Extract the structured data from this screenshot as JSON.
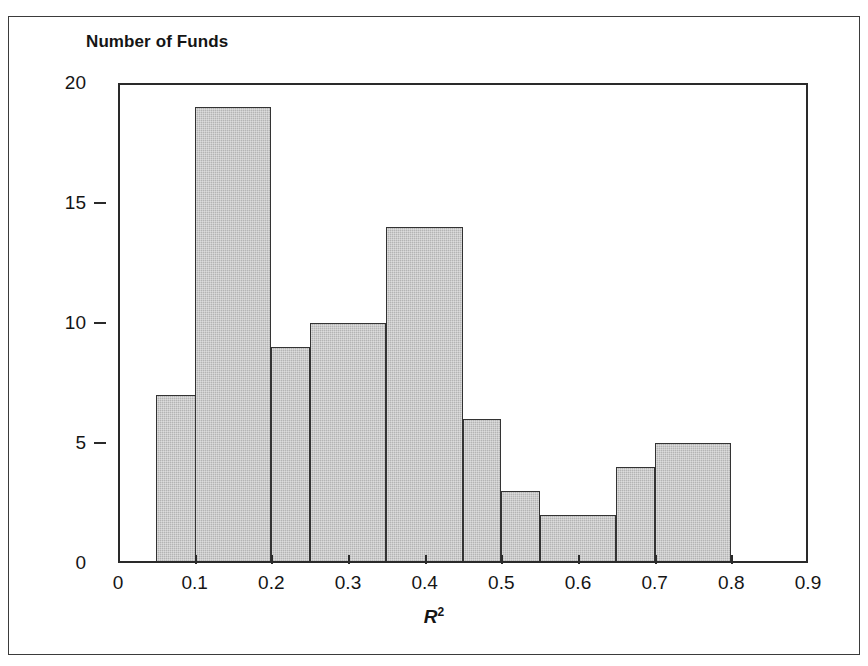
{
  "figure": {
    "clipped_caption": "",
    "background_color": "#ffffff",
    "frame_color": "#3b3b3b"
  },
  "axes": {
    "y_axis_title": "Number of Funds",
    "x_axis_title": "R",
    "x_axis_title_exponent": "2",
    "y_ticks": [
      "0",
      "5",
      "10",
      "15",
      "20"
    ],
    "x_ticks": [
      "0",
      "0.1",
      "0.2",
      "0.3",
      "0.4",
      "0.5",
      "0.6",
      "0.7",
      "0.8",
      "0.9"
    ]
  },
  "chart_data": {
    "type": "bar",
    "title": "",
    "subtitle": "",
    "xlabel": "R^2",
    "ylabel": "Number of Funds",
    "xlim": [
      0,
      0.9
    ],
    "ylim": [
      0,
      20
    ],
    "grid": false,
    "legend": "none",
    "bin_width": 0.05,
    "bin_edges": [
      0.05,
      0.1,
      0.15,
      0.2,
      0.25,
      0.3,
      0.35,
      0.4,
      0.45,
      0.5,
      0.55,
      0.6,
      0.65,
      0.7,
      0.75,
      0.8
    ],
    "categories": [
      "0.05-0.10",
      "0.10-0.15",
      "0.15-0.20",
      "0.20-0.25",
      "0.25-0.30",
      "0.30-0.35",
      "0.35-0.40",
      "0.40-0.45",
      "0.45-0.50",
      "0.50-0.55",
      "0.55-0.60",
      "0.60-0.65",
      "0.65-0.70",
      "0.70-0.75",
      "0.75-0.80"
    ],
    "values": [
      7,
      19,
      19,
      9,
      9,
      10,
      14,
      14,
      6,
      3,
      2,
      2,
      4,
      5,
      5
    ],
    "bars": [
      {
        "label": "0.05-0.15",
        "x_start": 0.05,
        "x_end": 0.15,
        "value": 7
      },
      {
        "label": "0.10-0.20",
        "x_start": 0.1,
        "x_end": 0.2,
        "value": 19
      },
      {
        "label": "0.20-0.25",
        "x_start": 0.2,
        "x_end": 0.25,
        "value": 9
      },
      {
        "label": "0.25-0.35",
        "x_start": 0.25,
        "x_end": 0.35,
        "value": 10
      },
      {
        "label": "0.35-0.45",
        "x_start": 0.35,
        "x_end": 0.45,
        "value": 14
      },
      {
        "label": "0.45-0.50",
        "x_start": 0.45,
        "x_end": 0.5,
        "value": 6
      },
      {
        "label": "0.50-0.55",
        "x_start": 0.5,
        "x_end": 0.55,
        "value": 3
      },
      {
        "label": "0.55-0.65",
        "x_start": 0.55,
        "x_end": 0.65,
        "value": 2
      },
      {
        "label": "0.65-0.70",
        "x_start": 0.65,
        "x_end": 0.7,
        "value": 4
      },
      {
        "label": "0.70-0.80",
        "x_start": 0.7,
        "x_end": 0.8,
        "value": 5
      }
    ],
    "bar_fill_color": "#b4b4b4",
    "bar_edge_color": "#333333"
  }
}
